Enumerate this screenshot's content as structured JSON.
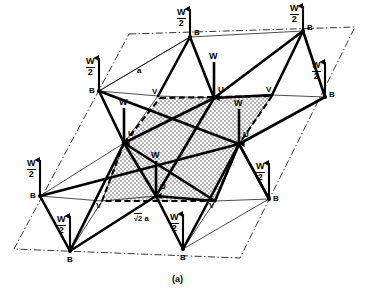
{
  "figure": {
    "caption": "(a)",
    "background_color": "#ffffff",
    "line_color": "#000000",
    "shade_color": "#c8c8c8",
    "edge_labels": {
      "a": "a",
      "sqrt2a_radical": "√2",
      "sqrt2a_operand": "a"
    },
    "site_labels": {
      "B": "B",
      "U": "U",
      "V": "V"
    },
    "moment_labels": {
      "half": {
        "numerator": "W",
        "denominator": "2"
      },
      "full": "W"
    },
    "sites": [
      {
        "id": "B-top-center",
        "label": "B",
        "x": 190,
        "y": 37,
        "moment": "W/2",
        "dir": "up",
        "label_side": "right"
      },
      {
        "id": "B-top-right",
        "label": "B",
        "x": 303,
        "y": 31,
        "moment": "W/2",
        "dir": "up",
        "label_side": "right"
      },
      {
        "id": "B-left-upper",
        "label": "B",
        "x": 99,
        "y": 91,
        "moment": "W/2",
        "dir": "up",
        "label_side": "below"
      },
      {
        "id": "B-right-upper",
        "label": "B",
        "x": 325,
        "y": 97,
        "moment": "W/2",
        "dir": "up",
        "label_side": "right"
      },
      {
        "id": "B-left-lower",
        "label": "B",
        "x": 40,
        "y": 196,
        "moment": "W/2",
        "dir": "up",
        "label_side": "below"
      },
      {
        "id": "B-right-lower",
        "label": "B",
        "x": 269,
        "y": 199,
        "moment": "W/2",
        "dir": "up",
        "label_side": "right"
      },
      {
        "id": "B-bot-left",
        "label": "B",
        "x": 70,
        "y": 251,
        "moment": "W/2",
        "dir": "up",
        "label_side": "below"
      },
      {
        "id": "B-bot-center",
        "label": "B",
        "x": 183,
        "y": 249,
        "moment": "W/2",
        "dir": "up",
        "label_side": "below"
      },
      {
        "id": "U-top-center",
        "label": "U",
        "x": 214,
        "y": 98,
        "moment": "W",
        "dir": "down",
        "label_side": "right"
      },
      {
        "id": "U-mid-left",
        "label": "U",
        "x": 124,
        "y": 143,
        "moment": "W",
        "dir": "down",
        "label_side": "right"
      },
      {
        "id": "U-mid-right",
        "label": "U",
        "x": 239,
        "y": 144,
        "moment": "W",
        "dir": "down",
        "label_side": "right"
      },
      {
        "id": "U-bot-center",
        "label": "U",
        "x": 156,
        "y": 196,
        "moment": "W",
        "dir": "down",
        "label_side": "right"
      },
      {
        "id": "V-upper-left",
        "label": "V",
        "x": 158,
        "y": 96,
        "moment": null,
        "dir": null,
        "label_side": "left"
      },
      {
        "id": "V-upper-right",
        "label": "V",
        "x": 272,
        "y": 95,
        "moment": null,
        "dir": null,
        "label_side": "left"
      },
      {
        "id": "V-lower-left",
        "label": "V",
        "x": 102,
        "y": 201,
        "moment": null,
        "dir": null,
        "label_side": "left"
      },
      {
        "id": "V-lower-right",
        "label": "V",
        "x": 215,
        "y": 201,
        "moment": null,
        "dir": null,
        "label_side": "left"
      }
    ],
    "legend": {
      "B_description": "B site, moment W/2 up",
      "U_description": "U site, moment W down",
      "V_description": "V site, no moment shown"
    }
  }
}
